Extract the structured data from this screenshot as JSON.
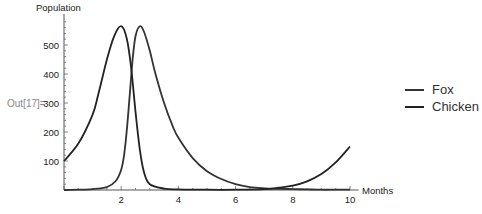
{
  "cell": {
    "out_label": "Out[17]="
  },
  "chart_data": {
    "type": "line",
    "title": "",
    "xlabel": "Months",
    "ylabel": "Population",
    "xlim": [
      0,
      10
    ],
    "ylim": [
      0,
      600
    ],
    "x_ticks": [
      2,
      4,
      6,
      8,
      10
    ],
    "y_ticks": [
      100,
      200,
      300,
      400,
      500
    ],
    "grid": false,
    "legend_position": "right",
    "series": [
      {
        "name": "Fox",
        "color": "#333333",
        "x": [
          0,
          0.5,
          1.0,
          1.5,
          1.8,
          2.0,
          2.1,
          2.2,
          2.3,
          2.4,
          2.5,
          2.65,
          2.8,
          3.0,
          3.2,
          3.5,
          3.8,
          4.0,
          4.5,
          5.0,
          5.5,
          6.0,
          6.5,
          7.0,
          7.5,
          8.0,
          8.5,
          9.0,
          9.5,
          10.0
        ],
        "values": [
          0,
          1,
          3,
          10,
          30,
          70,
          120,
          210,
          330,
          450,
          530,
          565,
          545,
          480,
          400,
          300,
          220,
          180,
          110,
          65,
          38,
          20,
          10,
          6,
          4,
          3,
          2,
          1,
          1,
          1
        ]
      },
      {
        "name": "Chicken",
        "color": "#222222",
        "x": [
          0,
          0.5,
          1.0,
          1.2,
          1.5,
          1.75,
          2.0,
          2.2,
          2.35,
          2.5,
          2.65,
          2.8,
          3.0,
          3.5,
          4.0,
          5.0,
          6.0,
          7.0,
          7.5,
          8.0,
          8.5,
          9.0,
          9.5,
          10.0
        ],
        "values": [
          100,
          160,
          260,
          330,
          450,
          530,
          565,
          520,
          420,
          270,
          140,
          60,
          20,
          5,
          2,
          1,
          1,
          3,
          8,
          15,
          30,
          55,
          95,
          150
        ]
      }
    ]
  },
  "legend": {
    "items": [
      {
        "label": "Fox"
      },
      {
        "label": "Chicken"
      }
    ]
  }
}
